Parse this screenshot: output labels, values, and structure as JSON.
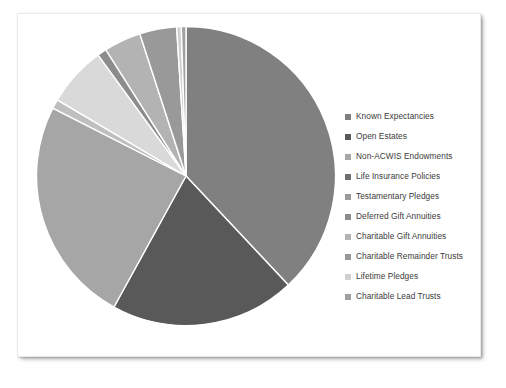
{
  "chart_data": {
    "type": "pie",
    "title": "",
    "subtitle": "",
    "legend_position": "right",
    "grid": false,
    "start_angle_deg": 0,
    "direction": "clockwise",
    "categories": [
      "Known Expectancies",
      "Open Estates",
      "Non-ACWIS Endowments",
      "Life Insurance Policies",
      "Testamentary Pledges",
      "Deferred Gift Annuities",
      "Charitable Gift Annuities",
      "Charitable Remainder Trusts",
      "Lifetime Pledges",
      "Charitable Lead Trusts"
    ],
    "values": [
      38.0,
      20.0,
      24.5,
      1.0,
      6.5,
      1.0,
      4.0,
      4.0,
      0.5,
      0.5
    ],
    "colors": [
      "#808080",
      "#595959",
      "#a6a6a6",
      "#bfbfbf",
      "#d9d9d9",
      "#8c8c8c",
      "#b3b3b3",
      "#999999",
      "#d0d0d0",
      "#a0a0a0"
    ],
    "slice_border_color": "#ffffff",
    "slice_border_width": 1.4,
    "xlabel": "",
    "ylabel": ""
  },
  "legend": {
    "items": [
      {
        "label": "Known Expectancies",
        "color": "#808080"
      },
      {
        "label": "Open Estates",
        "color": "#595959"
      },
      {
        "label": "Non-ACWIS Endowments",
        "color": "#a6a6a6"
      },
      {
        "label": "Life Insurance Policies",
        "color": "#6e6e6e"
      },
      {
        "label": "Testamentary Pledges",
        "color": "#9a9a9a"
      },
      {
        "label": "Deferred Gift Annuities",
        "color": "#8c8c8c"
      },
      {
        "label": "Charitable Gift Annuities",
        "color": "#b3b3b3"
      },
      {
        "label": "Charitable Remainder Trusts",
        "color": "#999999"
      },
      {
        "label": "Lifetime Pledges",
        "color": "#d0d0d0"
      },
      {
        "label": "Charitable Lead Trusts",
        "color": "#a0a0a0"
      }
    ]
  }
}
